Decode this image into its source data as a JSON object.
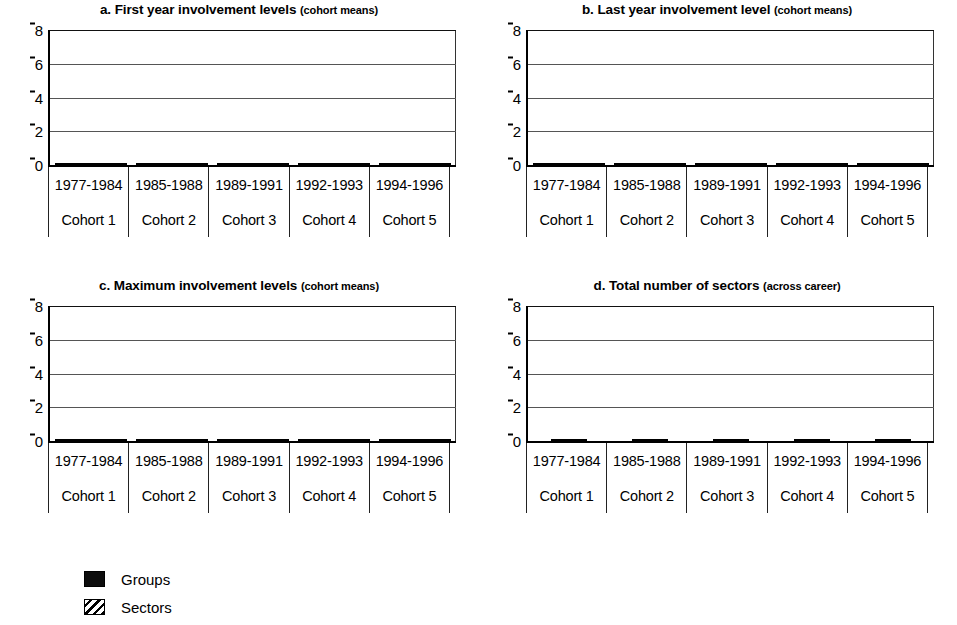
{
  "figure": {
    "axis_color": "#000000",
    "groups_color": "#0d0d0d",
    "sectors_color": "#ffffff"
  },
  "legend": {
    "items": [
      {
        "key": "groups",
        "label": "Groups",
        "swatch": "solid-black-swatch"
      },
      {
        "key": "sectors",
        "label": "Sectors",
        "swatch": "diagonal-hatch-swatch"
      }
    ]
  },
  "panels": [
    {
      "id": "a",
      "title_main": "a. First year involvement levels",
      "title_sub": "(cohort means)"
    },
    {
      "id": "b",
      "title_main": "b. Last year involvement level",
      "title_sub": "(cohort means)"
    },
    {
      "id": "c",
      "title_main": "c. Maximum involvement levels",
      "title_sub": "(cohort means)"
    },
    {
      "id": "d",
      "title_main": "d. Total number of sectors",
      "title_sub": "(across career)"
    }
  ],
  "chart_data": [
    {
      "type": "bar",
      "panel": "a",
      "title": "a. First year involvement levels (cohort means)",
      "xlabel": "",
      "ylabel": "",
      "ylim": [
        0,
        8
      ],
      "yticks": [
        0,
        2,
        4,
        6,
        8
      ],
      "grid": true,
      "legend_position": "below-figure",
      "categories": [
        "1977-1984",
        "1985-1988",
        "1989-1991",
        "1992-1993",
        "1994-1996"
      ],
      "category_sublabels": [
        "Cohort 1",
        "Cohort 2",
        "Cohort 3",
        "Cohort 4",
        "Cohort 5"
      ],
      "series": [
        {
          "name": "Groups",
          "values": [
            1.7,
            1.55,
            1.75,
            2.0,
            2.05
          ]
        },
        {
          "name": "Sectors",
          "values": [
            1.25,
            1.2,
            1.35,
            1.55,
            1.5
          ]
        }
      ]
    },
    {
      "type": "bar",
      "panel": "b",
      "title": "b. Last year involvement level (cohort means)",
      "xlabel": "",
      "ylabel": "",
      "ylim": [
        0,
        8
      ],
      "yticks": [
        0,
        2,
        4,
        6,
        8
      ],
      "grid": true,
      "legend_position": "below-figure",
      "categories": [
        "1977-1984",
        "1985-1988",
        "1989-1991",
        "1992-1993",
        "1994-1996"
      ],
      "category_sublabels": [
        "Cohort 1",
        "Cohort 2",
        "Cohort 3",
        "Cohort 4",
        "Cohort 5"
      ],
      "series": [
        {
          "name": "Groups",
          "values": [
            4.7,
            5.3,
            4.1,
            3.75,
            2.95
          ]
        },
        {
          "name": "Sectors",
          "values": [
            3.2,
            3.15,
            2.45,
            2.5,
            1.9
          ]
        }
      ]
    },
    {
      "type": "bar",
      "panel": "c",
      "title": "c. Maximum involvement levels (cohort means)",
      "xlabel": "",
      "ylabel": "",
      "ylim": [
        0,
        8
      ],
      "yticks": [
        0,
        2,
        4,
        6,
        8
      ],
      "grid": true,
      "legend_position": "below-figure",
      "categories": [
        "1977-1984",
        "1985-1988",
        "1989-1991",
        "1992-1993",
        "1994-1996"
      ],
      "category_sublabels": [
        "Cohort 1",
        "Cohort 2",
        "Cohort 3",
        "Cohort 4",
        "Cohort 5"
      ],
      "series": [
        {
          "name": "Groups",
          "values": [
            6.1,
            6.55,
            4.9,
            4.3,
            3.1
          ]
        },
        {
          "name": "Sectors",
          "values": [
            4.0,
            4.05,
            3.05,
            2.85,
            1.95
          ]
        }
      ]
    },
    {
      "type": "bar",
      "panel": "d",
      "title": "d. Total number of sectors (across career)",
      "xlabel": "",
      "ylabel": "",
      "ylim": [
        0,
        8
      ],
      "yticks": [
        0,
        2,
        4,
        6,
        8
      ],
      "grid": true,
      "legend_position": "below-figure",
      "categories": [
        "1977-1984",
        "1985-1988",
        "1989-1991",
        "1992-1993",
        "1994-1996"
      ],
      "category_sublabels": [
        "Cohort 1",
        "Cohort 2",
        "Cohort 3",
        "Cohort 4",
        "Cohort 5"
      ],
      "series": [
        {
          "name": "Sectors",
          "values": [
            5.35,
            5.05,
            3.8,
            3.4,
            2.05
          ]
        }
      ]
    }
  ]
}
